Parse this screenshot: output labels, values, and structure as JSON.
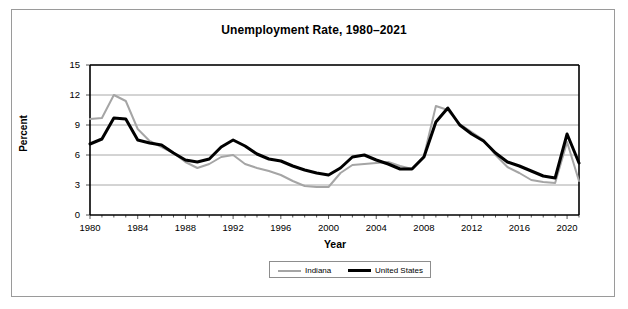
{
  "figure": {
    "width": 628,
    "height": 309,
    "background": "#ffffff",
    "frame_color": "#9a9a9a"
  },
  "chart_data": {
    "type": "line",
    "title": "Unemployment Rate, 1980–2021",
    "xlabel": "Year",
    "ylabel": "Percent",
    "xlim": [
      1980,
      2021
    ],
    "ylim": [
      0,
      15
    ],
    "ytick_values": [
      0,
      3,
      6,
      9,
      12,
      15
    ],
    "ytick_labels": [
      "0",
      "3",
      "6",
      "9",
      "12",
      "15"
    ],
    "xtick_values": [
      1980,
      1984,
      1988,
      1992,
      1996,
      2000,
      2004,
      2008,
      2012,
      2016,
      2020
    ],
    "xtick_labels": [
      "1980",
      "1984",
      "1988",
      "1992",
      "1996",
      "2000",
      "2004",
      "2008",
      "2012",
      "2016",
      "2020"
    ],
    "grid": "horizontal",
    "grid_color": "#a8a8a8",
    "legend_position": "bottom-center",
    "x": [
      1980,
      1981,
      1982,
      1983,
      1984,
      1985,
      1986,
      1987,
      1988,
      1989,
      1990,
      1991,
      1992,
      1993,
      1994,
      1995,
      1996,
      1997,
      1998,
      1999,
      2000,
      2001,
      2002,
      2003,
      2004,
      2005,
      2006,
      2007,
      2008,
      2009,
      2010,
      2011,
      2012,
      2013,
      2014,
      2015,
      2016,
      2017,
      2018,
      2019,
      2020,
      2021
    ],
    "series": [
      {
        "name": "Indiana",
        "color": "#a5a5a5",
        "width": 2,
        "values": [
          9.6,
          9.7,
          12.0,
          11.4,
          8.6,
          7.4,
          6.8,
          6.2,
          5.3,
          4.7,
          5.1,
          5.8,
          6.0,
          5.1,
          4.7,
          4.4,
          4.0,
          3.4,
          2.9,
          2.8,
          2.8,
          4.2,
          5.0,
          5.1,
          5.2,
          5.3,
          4.9,
          4.6,
          5.9,
          10.9,
          10.5,
          9.1,
          8.3,
          7.5,
          6.0,
          4.8,
          4.2,
          3.5,
          3.3,
          3.2,
          7.3,
          3.4
        ]
      },
      {
        "name": "United States",
        "color": "#000000",
        "width": 3,
        "values": [
          7.1,
          7.6,
          9.7,
          9.6,
          7.5,
          7.2,
          7.0,
          6.2,
          5.5,
          5.3,
          5.6,
          6.8,
          7.5,
          6.9,
          6.1,
          5.6,
          5.4,
          4.9,
          4.5,
          4.2,
          4.0,
          4.7,
          5.8,
          6.0,
          5.5,
          5.1,
          4.6,
          4.6,
          5.8,
          9.3,
          10.7,
          9.0,
          8.1,
          7.4,
          6.2,
          5.3,
          4.9,
          4.4,
          3.9,
          3.7,
          8.1,
          5.2
        ]
      }
    ]
  },
  "legend": {
    "items": [
      {
        "label": "Indiana",
        "color": "#a5a5a5"
      },
      {
        "label": "United States",
        "color": "#000000"
      }
    ]
  }
}
